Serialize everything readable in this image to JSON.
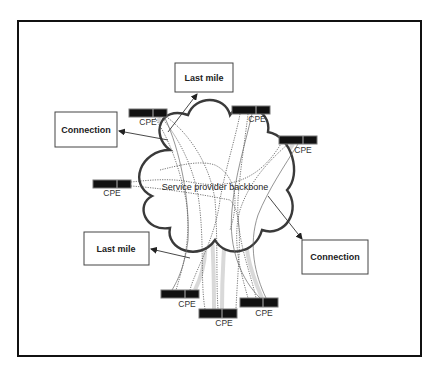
{
  "diagram": {
    "type": "network-topology",
    "backbone": {
      "label": "Service provider backbone",
      "label_x": 215,
      "label_y": 190
    },
    "boxes": [
      {
        "id": "last-mile-top",
        "label": "Last mile",
        "x": 175,
        "y": 63,
        "w": 58,
        "h": 29
      },
      {
        "id": "connection-left",
        "label": "Connection",
        "x": 55,
        "y": 112,
        "w": 62,
        "h": 35
      },
      {
        "id": "last-mile-bottom",
        "label": "Last mile",
        "x": 84,
        "y": 232,
        "w": 65,
        "h": 33
      },
      {
        "id": "connection-right",
        "label": "Connection",
        "x": 302,
        "y": 240,
        "w": 66,
        "h": 34
      }
    ],
    "cpes": [
      {
        "id": "cpe-top-left",
        "label": "CPE",
        "x": 129,
        "y": 109,
        "label_x": 148,
        "label_y": 125
      },
      {
        "id": "cpe-top-center",
        "label": "CPE",
        "x": 232,
        "y": 106,
        "label_x": 257,
        "label_y": 122
      },
      {
        "id": "cpe-right",
        "label": "CPE",
        "x": 279,
        "y": 136,
        "label_x": 303,
        "label_y": 153
      },
      {
        "id": "cpe-left",
        "label": "CPE",
        "x": 93,
        "y": 180,
        "label_x": 112,
        "label_y": 196
      },
      {
        "id": "cpe-bottom-left",
        "label": "CPE",
        "x": 161,
        "y": 290,
        "label_x": 187,
        "label_y": 307
      },
      {
        "id": "cpe-bottom-center",
        "label": "CPE",
        "x": 199,
        "y": 309,
        "label_x": 224,
        "label_y": 326
      },
      {
        "id": "cpe-bottom-right",
        "label": "CPE",
        "x": 240,
        "y": 298,
        "label_x": 264,
        "label_y": 316
      }
    ],
    "arrows": [
      {
        "id": "arrow-to-last-mile-top",
        "from": [
          168,
          132
        ],
        "to": [
          197,
          94
        ]
      },
      {
        "id": "arrow-to-connection-left",
        "from": [
          168,
          140
        ],
        "to": [
          119,
          131
        ]
      },
      {
        "id": "arrow-to-last-mile-bottom",
        "from": [
          190,
          258
        ],
        "to": [
          151,
          249
        ]
      },
      {
        "id": "arrow-to-connection-right",
        "from": [
          268,
          196
        ],
        "to": [
          302,
          239
        ]
      }
    ],
    "colors": {
      "frame": "#111111",
      "cloud_outline": "#3a3a3a",
      "cpe_fill": "#111111",
      "background": "#ffffff"
    }
  }
}
